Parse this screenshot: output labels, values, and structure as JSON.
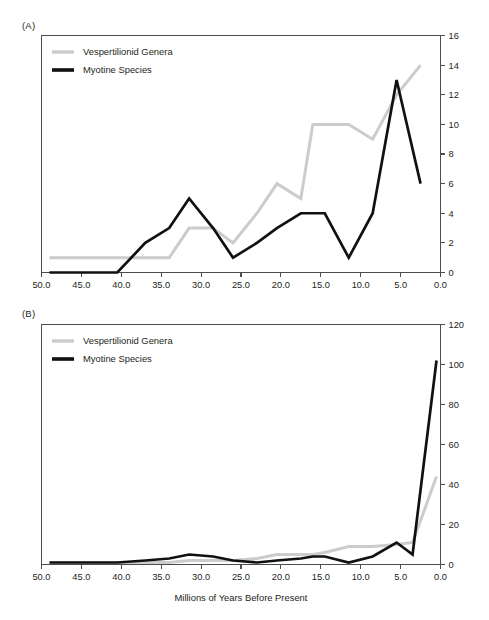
{
  "figure": {
    "background": "#ffffff",
    "series_colors": {
      "vespertilionid_genera": "#cccccc",
      "myotine_species": "#111111"
    }
  },
  "panels": [
    {
      "id": "A",
      "label": "(A)",
      "legend": [
        {
          "name": "vespertilionid-genera",
          "label": "Vespertilionid Genera",
          "color": "#cccccc"
        },
        {
          "name": "myotine-species",
          "label": "Myotine Species",
          "color": "#111111"
        }
      ],
      "xlabel": "",
      "ylabel": "",
      "x_ticks": [
        "50.0",
        "45.0",
        "40.0",
        "35.0",
        "30.0",
        "25.0",
        "20.0",
        "15.0",
        "10.0",
        "5.0",
        "0.0"
      ],
      "y_ticks": [
        "0",
        "2",
        "4",
        "6",
        "8",
        "10",
        "12",
        "14",
        "16"
      ]
    },
    {
      "id": "B",
      "label": "(B)",
      "legend": [
        {
          "name": "vespertilionid-genera",
          "label": "Vespertilionid Genera",
          "color": "#cccccc"
        },
        {
          "name": "myotine-species",
          "label": "Myotine Species",
          "color": "#111111"
        }
      ],
      "xlabel": "Millions of Years Before Present",
      "ylabel": "",
      "x_ticks": [
        "50.0",
        "45.0",
        "40.0",
        "35.0",
        "30.0",
        "25.0",
        "20.0",
        "15.0",
        "10.0",
        "5.0",
        "0.0"
      ],
      "y_ticks": [
        "0",
        "20",
        "40",
        "60",
        "80",
        "100",
        "120"
      ]
    }
  ],
  "chart_data": [
    {
      "type": "line",
      "panel": "A",
      "title": "(A)",
      "xlabel": "",
      "ylabel": "",
      "xlim": [
        50.0,
        0.0
      ],
      "ylim": [
        0,
        16
      ],
      "x_reversed": true,
      "grid": false,
      "legend_position": "top-left",
      "x_ticks": [
        50.0,
        45.0,
        40.0,
        35.0,
        30.0,
        25.0,
        20.0,
        15.0,
        10.0,
        5.0,
        0.0
      ],
      "y_ticks": [
        0,
        2,
        4,
        6,
        8,
        10,
        12,
        14,
        16
      ],
      "x": [
        49.0,
        46.0,
        43.0,
        40.5,
        37.0,
        34.0,
        31.5,
        28.5,
        26.0,
        23.0,
        20.5,
        17.5,
        16.0,
        14.5,
        11.5,
        8.5,
        5.5,
        2.5
      ],
      "series": [
        {
          "name": "Vespertilionid Genera",
          "color": "#cccccc",
          "values": [
            1,
            1,
            1,
            1,
            1,
            1,
            3,
            3,
            2,
            4,
            6,
            5,
            10,
            10,
            10,
            9,
            12,
            14
          ]
        },
        {
          "name": "Myotine Species",
          "color": "#111111",
          "values": [
            0,
            0,
            0,
            0,
            2,
            3,
            5,
            3,
            1,
            2,
            3,
            4,
            4,
            4,
            1,
            4,
            13,
            6
          ]
        }
      ]
    },
    {
      "type": "line",
      "panel": "B",
      "title": "(B)",
      "xlabel": "Millions of Years Before Present",
      "ylabel": "",
      "xlim": [
        50.0,
        0.0
      ],
      "ylim": [
        0,
        120
      ],
      "x_reversed": true,
      "grid": false,
      "legend_position": "top-left",
      "x_ticks": [
        50.0,
        45.0,
        40.0,
        35.0,
        30.0,
        25.0,
        20.0,
        15.0,
        10.0,
        5.0,
        0.0
      ],
      "y_ticks": [
        0,
        20,
        40,
        60,
        80,
        100,
        120
      ],
      "x": [
        49.0,
        46.0,
        43.0,
        40.5,
        37.0,
        34.0,
        31.5,
        28.5,
        26.0,
        23.0,
        20.5,
        17.5,
        16.0,
        14.5,
        11.5,
        8.5,
        5.5,
        3.5,
        0.5
      ],
      "series": [
        {
          "name": "Vespertilionid Genera",
          "color": "#cccccc",
          "values": [
            1,
            1,
            1,
            1,
            1,
            1,
            2,
            2,
            2,
            3,
            5,
            5,
            5,
            6,
            9,
            9,
            10,
            11,
            44
          ]
        },
        {
          "name": "Myotine Species",
          "color": "#111111",
          "values": [
            1,
            1,
            1,
            1,
            2,
            3,
            5,
            4,
            2,
            1,
            2,
            3,
            4,
            4,
            1,
            4,
            11,
            5,
            102
          ]
        }
      ]
    }
  ]
}
